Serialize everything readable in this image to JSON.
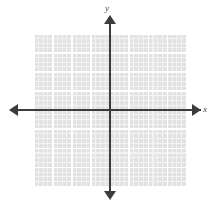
{
  "figure": {
    "title": "",
    "type": "coordinate-plane"
  },
  "axes": {
    "x_label": "x",
    "y_label": "y",
    "axis_color": "#3c3c3c",
    "label_color": "#4a4a4a"
  },
  "grid": {
    "background_color": "#e2e2e2",
    "major_line_color": "#ffffff",
    "minor_line_color": "#f2f2f2"
  },
  "chart_data": {
    "type": "scatter",
    "title": "",
    "xlabel": "x",
    "ylabel": "y",
    "x": [],
    "y": [],
    "series": [],
    "annotations": [],
    "legend": [],
    "grid": true,
    "legend_position": "none",
    "xlim": [
      -8,
      8
    ],
    "ylim": [
      -8,
      8
    ],
    "xticks": [],
    "yticks": [],
    "xticklabels": [],
    "yticklabels": [],
    "major_gridline_spacing": 1,
    "minor_gridlines_per_major": 4,
    "origin_marked": false
  }
}
